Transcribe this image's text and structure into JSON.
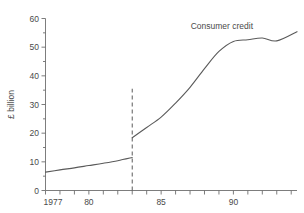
{
  "chart_data": {
    "type": "line",
    "title": "",
    "xlabel": "",
    "ylabel": "£ billion",
    "xlim": [
      1977,
      1994.4
    ],
    "ylim": [
      0,
      60
    ],
    "grid": false,
    "legend_position": "none",
    "y_ticks": [
      0,
      10,
      20,
      30,
      40,
      50,
      60
    ],
    "y_tick_labels": [
      "0",
      "10",
      "20",
      "30",
      "40",
      "50",
      "60"
    ],
    "y_minor_tick_interval": 5,
    "x_ticks": [
      1977,
      1978,
      1979,
      1980,
      1981,
      1982,
      1983,
      1984,
      1985,
      1986,
      1987,
      1988,
      1989,
      1990,
      1991,
      1992,
      1993,
      1994
    ],
    "x_labeled_ticks": [
      {
        "x": 1977,
        "label": "1977"
      },
      {
        "x": 1980,
        "label": "80"
      },
      {
        "x": 1985,
        "label": "85"
      },
      {
        "x": 1990,
        "label": "90"
      }
    ],
    "annotations": [
      {
        "text": "Consumer credit",
        "x": 1989.2,
        "y": 56.5
      }
    ],
    "break_marker": {
      "type": "vertical-dashed-line",
      "x": 1983,
      "y_from": 0,
      "y_to": 35.5,
      "note": "series definition break"
    },
    "series": [
      {
        "name": "Consumer credit (old basis)",
        "x": [
          1977,
          1978,
          1979,
          1980,
          1981,
          1982,
          1983
        ],
        "values": [
          6.4,
          7.2,
          7.9,
          8.7,
          9.5,
          10.4,
          11.5
        ]
      },
      {
        "name": "Consumer credit (new basis)",
        "x": [
          1983,
          1984,
          1985,
          1986,
          1987,
          1988,
          1989,
          1990,
          1991,
          1992,
          1993,
          1994.4
        ],
        "values": [
          18.4,
          22.0,
          25.6,
          30.5,
          36.0,
          42.5,
          48.5,
          52.0,
          52.6,
          53.2,
          52.2,
          55.4
        ]
      }
    ]
  }
}
